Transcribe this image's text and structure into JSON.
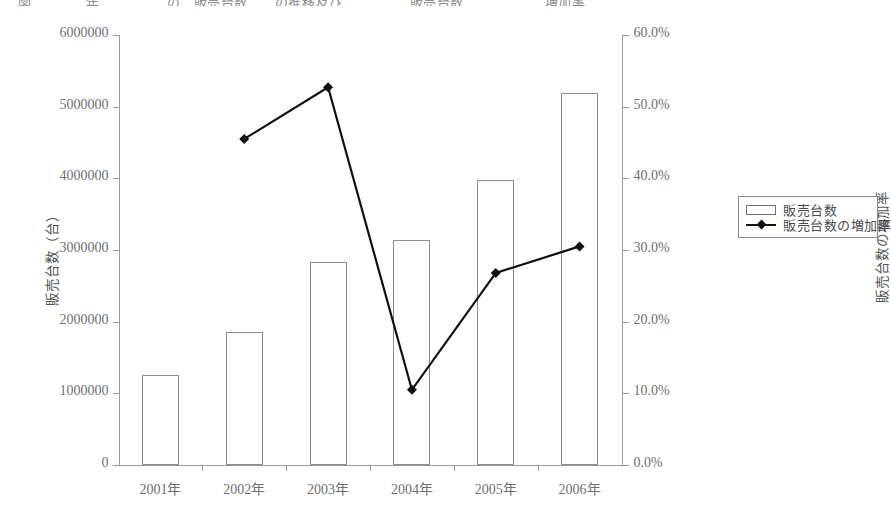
{
  "title_sliver": "図　　　　年　　　　　の　販売台数　　の推移及び　　　　　販売台数　　　　　　増加率",
  "legend": {
    "items": [
      {
        "label": "販売台数",
        "marker": "bar-swatch-icon"
      },
      {
        "label": "販売台数の増加率",
        "marker": "line-diamond-icon"
      }
    ]
  },
  "chart_data": {
    "type": "bar",
    "title": "",
    "categories": [
      "2001年",
      "2002年",
      "2003年",
      "2004年",
      "2005年",
      "2006年"
    ],
    "xlabel": "",
    "ylabel": "販売台数（台）",
    "y2label": "販売台数の増加率",
    "ylim": [
      0,
      6000000
    ],
    "y2lim": [
      0,
      0.6
    ],
    "yticks": [
      0,
      1000000,
      2000000,
      3000000,
      4000000,
      5000000,
      6000000
    ],
    "ytick_labels": [
      "0",
      "1000000",
      "2000000",
      "3000000",
      "4000000",
      "5000000",
      "6000000"
    ],
    "y2ticks": [
      0.0,
      0.1,
      0.2,
      0.3,
      0.4,
      0.5,
      0.6
    ],
    "y2tick_labels": [
      "0.0%",
      "10.0%",
      "20.0%",
      "30.0%",
      "40.0%",
      "50.0%",
      "60.0%"
    ],
    "grid": false,
    "legend_position": "right",
    "series": [
      {
        "name": "販売台数",
        "type": "bar",
        "axis": "left",
        "values": [
          1260000,
          1850000,
          2830000,
          3140000,
          3980000,
          5190000
        ]
      },
      {
        "name": "販売台数の増加率",
        "type": "line",
        "axis": "right",
        "marker": "diamond",
        "values": [
          null,
          0.455,
          0.527,
          0.105,
          0.268,
          0.305
        ]
      }
    ]
  }
}
